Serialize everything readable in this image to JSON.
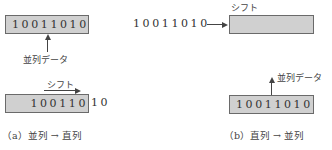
{
  "panel_a": {
    "register_top": {
      "value": "10011010"
    },
    "parallel_label": "並列データ",
    "shift_label": "シフト",
    "register_bottom": {
      "inside": "100110",
      "outside": "10"
    },
    "caption": "（a）並列 → 直列"
  },
  "panel_b": {
    "serial_input": "10011010",
    "shift_label": "シフト",
    "register_top": {
      "value": ""
    },
    "parallel_label": "並列データ",
    "register_bottom": {
      "value": "10011010"
    },
    "caption": "（b）直列 → 並列"
  },
  "colors": {
    "register_fill": "#d0d0d0",
    "register_border": "#6a6a6a",
    "line": "#444444"
  }
}
